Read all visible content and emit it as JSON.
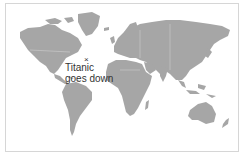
{
  "map": {
    "type": "world-political-outline",
    "land_color": "#a6a6a6",
    "water_color": "#ffffff",
    "border_color": "#d6d6d6",
    "annotation": {
      "marker_symbol": "×",
      "label_line1": "Titanic",
      "label_line2": "goes down",
      "text_color": "#333333"
    }
  }
}
